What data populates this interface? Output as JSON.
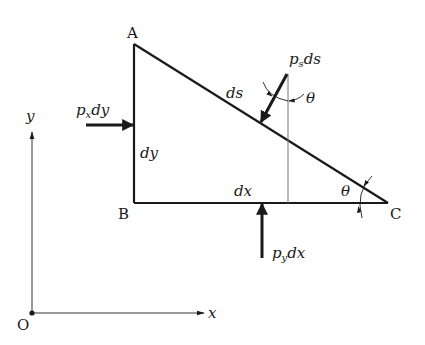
{
  "diagram": {
    "type": "free-body diagram of triangular fluid element",
    "points": {
      "A": {
        "label": "A"
      },
      "B": {
        "label": "B"
      },
      "C": {
        "label": "C"
      },
      "O": {
        "label": "O"
      }
    },
    "sides": {
      "vertical": {
        "label": "dy"
      },
      "horizontal": {
        "label": "dx"
      },
      "hypotenuse": {
        "label": "ds"
      }
    },
    "forces": {
      "px": {
        "base": "p",
        "sub": "x",
        "tail": "dy"
      },
      "py": {
        "base": "p",
        "sub": "y",
        "tail": "dx"
      },
      "ps": {
        "base": "p",
        "sub": "s",
        "tail": "ds"
      }
    },
    "angles": {
      "at_C": {
        "label": "θ"
      },
      "at_ps": {
        "label": "θ"
      }
    },
    "axes": {
      "x": {
        "label": "x"
      },
      "y": {
        "label": "y"
      }
    },
    "colors": {
      "line": "#1a1a1a",
      "thin": "#555555",
      "background": "#ffffff"
    }
  }
}
